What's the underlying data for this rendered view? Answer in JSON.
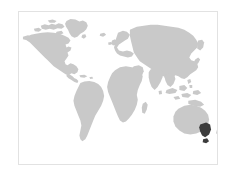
{
  "widget": {
    "type": "world-locator-map",
    "title": "",
    "background_color": "#ffffff"
  },
  "panel": {
    "border_color": "#e2e2e2",
    "fill_color": "#ffffff",
    "x": 18,
    "y": 11,
    "width": 200,
    "height": 154
  },
  "map": {
    "projection": "equirectangular",
    "land_color": "#c9c9c9",
    "ocean_color": "#ffffff",
    "highlight_color": "#3c3c3c",
    "graticule": false,
    "labels": [],
    "regions": [
      {
        "name": "north-america",
        "highlighted": false
      },
      {
        "name": "greenland",
        "highlighted": false
      },
      {
        "name": "south-america",
        "highlighted": false
      },
      {
        "name": "europe",
        "highlighted": false
      },
      {
        "name": "africa",
        "highlighted": false
      },
      {
        "name": "madagascar",
        "highlighted": false
      },
      {
        "name": "asia",
        "highlighted": false
      },
      {
        "name": "southeast-asia-archipelago",
        "highlighted": false
      },
      {
        "name": "japan",
        "highlighted": false
      },
      {
        "name": "australia",
        "highlighted": false
      },
      {
        "name": "new-zealand",
        "highlighted": false
      },
      {
        "name": "british-isles",
        "highlighted": false
      },
      {
        "name": "tasmania",
        "highlighted": false
      }
    ],
    "highlighted_region": {
      "name": "victoria-southeast-australia",
      "color": "#3c3c3c"
    }
  }
}
